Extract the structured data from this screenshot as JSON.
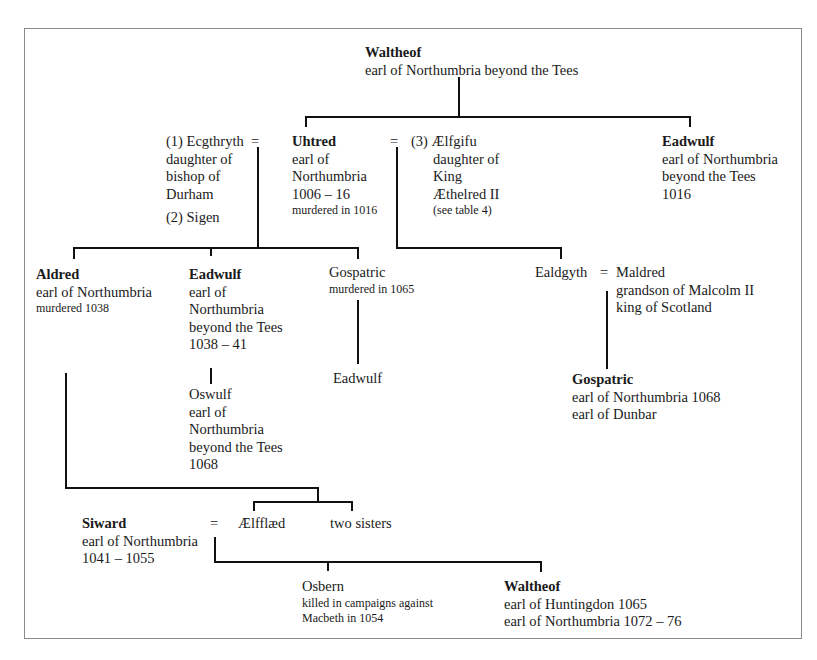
{
  "nodes": {
    "waltheof_root": {
      "name": "Waltheof",
      "lines": [
        "earl of Northumbria beyond the Tees"
      ]
    },
    "ecgthryth": {
      "name": "(1) Ecgthryth",
      "lines": [
        "daughter of",
        "bishop of",
        "Durham"
      ],
      "second_wife": "(2) Sigen"
    },
    "uhtred": {
      "name": "Uhtred",
      "lines": [
        "earl of",
        "Northumbria",
        "1006 – 16"
      ],
      "note": "murdered in 1016"
    },
    "aelfgifu": {
      "name": "(3) Ælfgifu",
      "lines": [
        "daughter of",
        "King",
        "Æthelred II"
      ],
      "note": "(see table 4)"
    },
    "eadwulf_1016": {
      "name": "Eadwulf",
      "lines": [
        "earl of Northumbria",
        "beyond the Tees",
        "1016"
      ]
    },
    "aldred": {
      "name": "Aldred",
      "lines": [
        "earl of Northumbria"
      ],
      "note": "murdered 1038"
    },
    "eadwulf_1038": {
      "name": "Eadwulf",
      "lines": [
        "earl of",
        "Northumbria",
        "beyond the Tees",
        "1038 – 41"
      ]
    },
    "gospatric_1065": {
      "name": "Gospatric",
      "note": "murdered in 1065"
    },
    "ealdgyth": {
      "name": "Ealdgyth"
    },
    "maldred": {
      "name": "Maldred",
      "lines": [
        "grandson of Malcolm II",
        "king of Scotland"
      ]
    },
    "oswulf": {
      "name": "Oswulf",
      "lines": [
        "earl of",
        "Northumbria",
        "beyond the Tees",
        "1068"
      ]
    },
    "eadwulf_son": {
      "name": "Eadwulf"
    },
    "gospatric_1068": {
      "name": "Gospatric",
      "lines": [
        "earl of Northumbria 1068",
        "earl of Dunbar"
      ]
    },
    "siward": {
      "name": "Siward",
      "lines": [
        "earl of Northumbria",
        "1041 – 1055"
      ]
    },
    "aelfflaed": {
      "name": "Ælfflæd"
    },
    "two_sisters": {
      "name": "two sisters"
    },
    "osbern": {
      "name": "Osbern",
      "notes": [
        "killed in campaigns against",
        "Macbeth in 1054"
      ]
    },
    "waltheof_2": {
      "name": "Waltheof",
      "lines": [
        "earl of Huntingdon 1065",
        "earl of Northumbria 1072 – 76"
      ]
    }
  },
  "symbols": {
    "marriage": "="
  }
}
